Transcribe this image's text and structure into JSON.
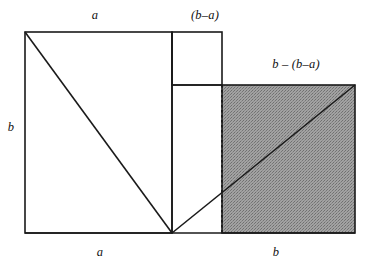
{
  "figure": {
    "background_color": "#ffffff",
    "stroke_color": "#1a1a1a",
    "shade_color": "#9a9a9a",
    "labels": {
      "a_top": "a",
      "b_minus_a_top": "(b–a)",
      "b_minus_bracket_b_minus_a": "b – (b–a)",
      "b_left": "b",
      "a_bottom": "a",
      "b_bottom": "b"
    },
    "geometry": {
      "outer_left": 25,
      "outer_top": 32,
      "outer_bottom": 233,
      "outer_right": 355,
      "mid_x": 172,
      "dotted_x": 222,
      "shaded_top": 85,
      "small_square": {
        "x1": 172,
        "y1": 32,
        "x2": 222,
        "y2": 85
      },
      "shaded_square": {
        "x1": 222,
        "y1": 85,
        "x2": 355,
        "y2": 233
      },
      "diagonal_left": {
        "x1": 25,
        "y1": 32,
        "x2": 172,
        "y2": 233
      },
      "diagonal_right": {
        "x1": 172,
        "y1": 233,
        "x2": 355,
        "y2": 85
      }
    }
  }
}
